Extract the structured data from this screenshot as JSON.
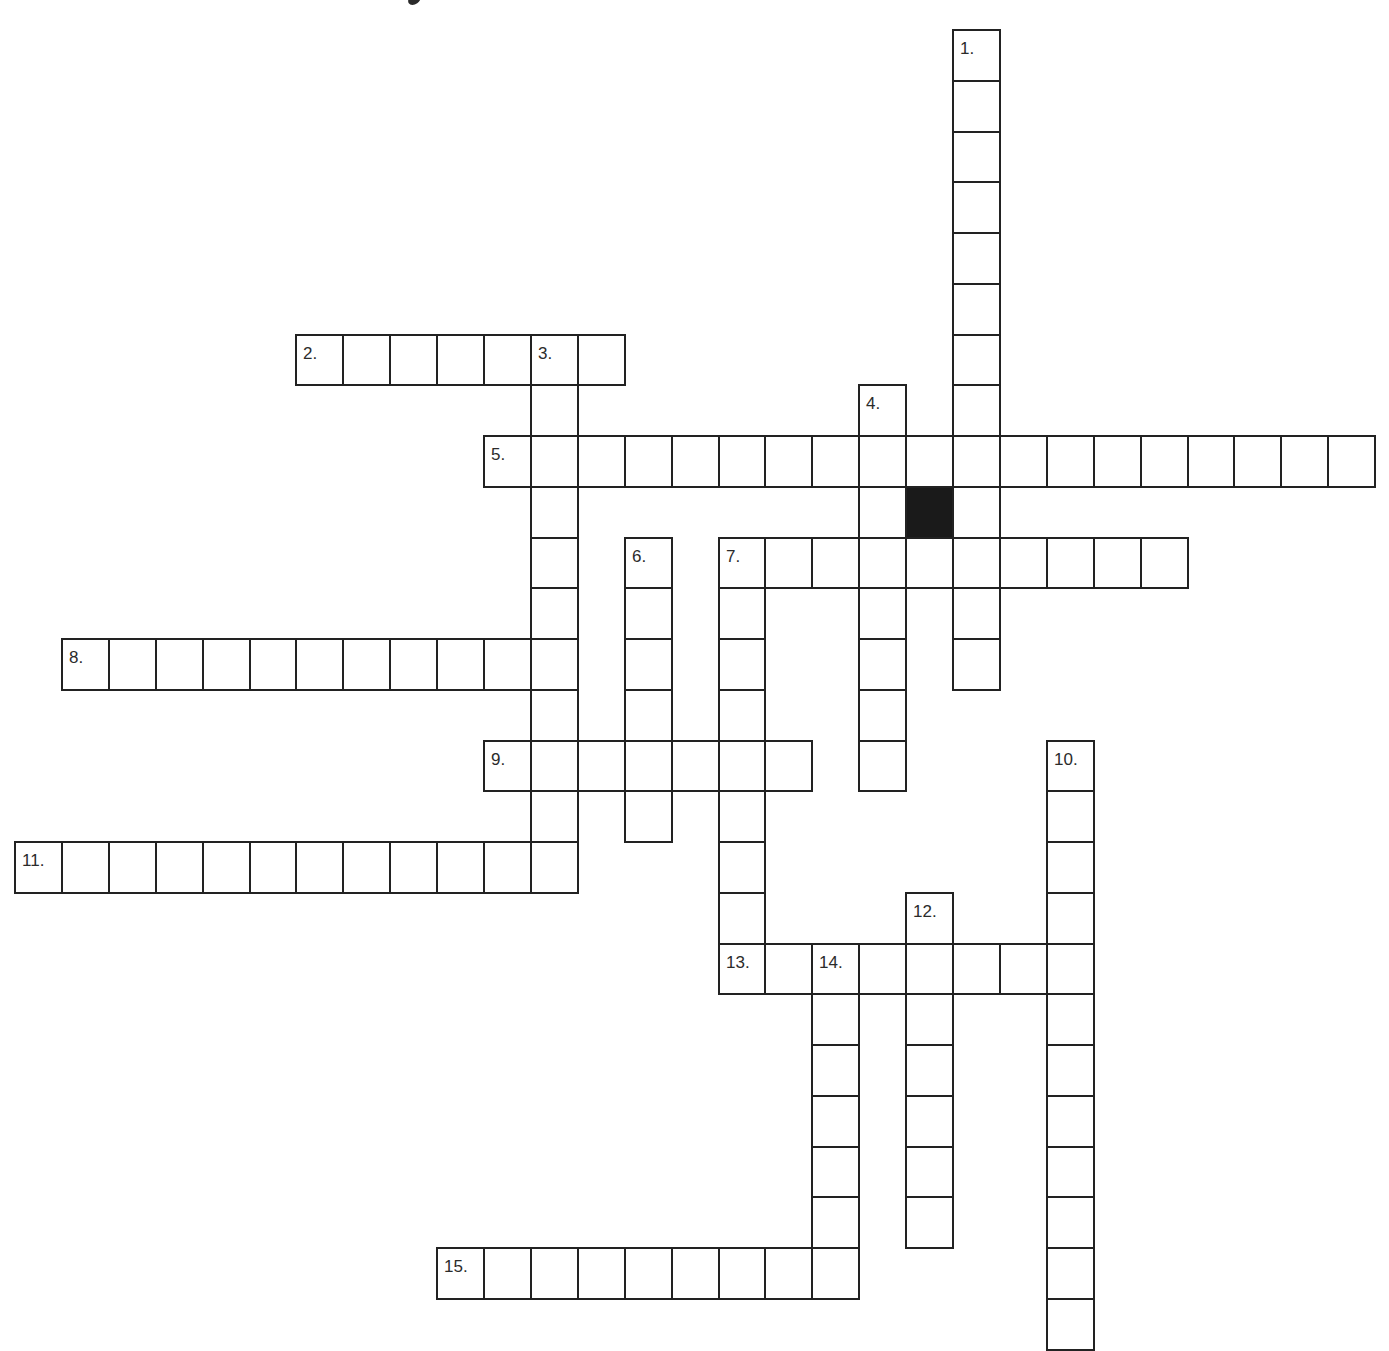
{
  "title_visible_fragment": "y",
  "grid": {
    "origin_x": 14,
    "origin_y": 29,
    "cell_width": 46.9,
    "cell_height": 50.75,
    "border_color": "#222222",
    "black_color": "#1a1a1a",
    "background_color": "#ffffff",
    "black_cells": [
      {
        "row": 9,
        "col": 19
      }
    ]
  },
  "words": [
    {
      "number": "1.",
      "direction": "down",
      "row": 0,
      "col": 20,
      "length": 13
    },
    {
      "number": "2.",
      "direction": "across",
      "row": 6,
      "col": 6,
      "length": 7
    },
    {
      "number": "3.",
      "direction": "down",
      "row": 6,
      "col": 11,
      "length": 11
    },
    {
      "number": "4.",
      "direction": "down",
      "row": 7,
      "col": 18,
      "length": 8
    },
    {
      "number": "5.",
      "direction": "across",
      "row": 8,
      "col": 10,
      "length": 19
    },
    {
      "number": "6.",
      "direction": "down",
      "row": 10,
      "col": 13,
      "length": 6
    },
    {
      "number": "7.",
      "direction": "across",
      "row": 10,
      "col": 15,
      "length": 10
    },
    {
      "number": "7.",
      "direction": "down",
      "row": 10,
      "col": 15,
      "length": 9
    },
    {
      "number": "8.",
      "direction": "across",
      "row": 12,
      "col": 1,
      "length": 11
    },
    {
      "number": "9.",
      "direction": "across",
      "row": 14,
      "col": 10,
      "length": 7
    },
    {
      "number": "10.",
      "direction": "down",
      "row": 14,
      "col": 22,
      "length": 12
    },
    {
      "number": "11.",
      "direction": "across",
      "row": 16,
      "col": 0,
      "length": 12
    },
    {
      "number": "12.",
      "direction": "down",
      "row": 17,
      "col": 19,
      "length": 7
    },
    {
      "number": "13.",
      "direction": "across",
      "row": 18,
      "col": 15,
      "length": 8
    },
    {
      "number": "14.",
      "direction": "down",
      "row": 18,
      "col": 17,
      "length": 7
    },
    {
      "number": "15.",
      "direction": "across",
      "row": 24,
      "col": 9,
      "length": 9
    }
  ],
  "clue_numbers": [
    {
      "label": "1.",
      "row": 0,
      "col": 20
    },
    {
      "label": "2.",
      "row": 6,
      "col": 6
    },
    {
      "label": "3.",
      "row": 6,
      "col": 11
    },
    {
      "label": "4.",
      "row": 7,
      "col": 18
    },
    {
      "label": "5.",
      "row": 8,
      "col": 10
    },
    {
      "label": "6.",
      "row": 10,
      "col": 13
    },
    {
      "label": "7.",
      "row": 10,
      "col": 15
    },
    {
      "label": "8.",
      "row": 12,
      "col": 1
    },
    {
      "label": "9.",
      "row": 14,
      "col": 10
    },
    {
      "label": "10.",
      "row": 14,
      "col": 22
    },
    {
      "label": "11.",
      "row": 16,
      "col": 0
    },
    {
      "label": "12.",
      "row": 17,
      "col": 19
    },
    {
      "label": "13.",
      "row": 18,
      "col": 15
    },
    {
      "label": "14.",
      "row": 18,
      "col": 17
    },
    {
      "label": "15.",
      "row": 24,
      "col": 9
    }
  ]
}
